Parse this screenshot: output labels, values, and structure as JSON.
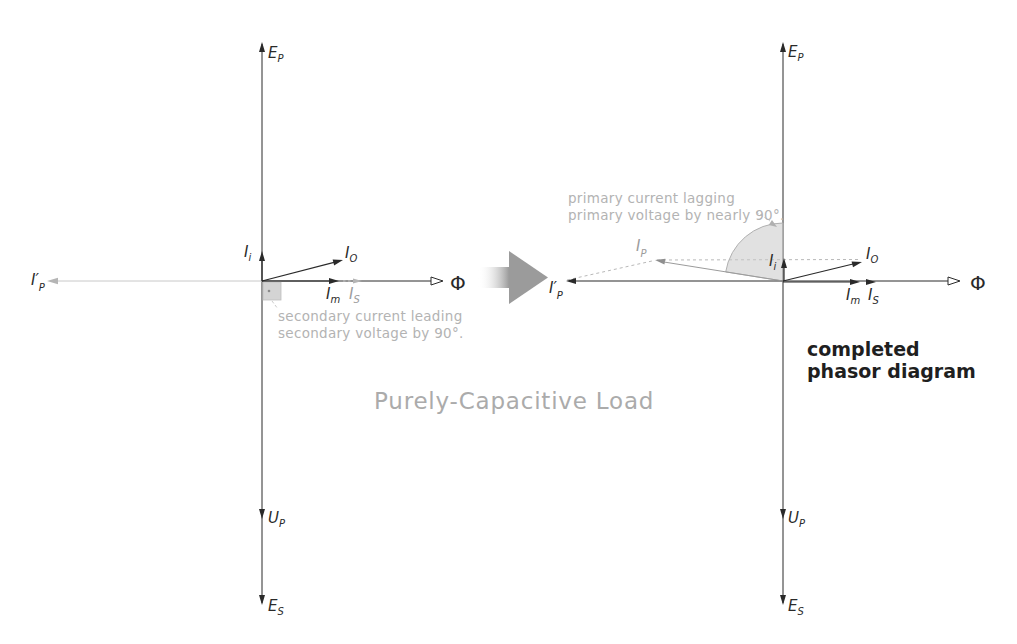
{
  "canvas": {
    "width": 1017,
    "height": 644,
    "background": "#ffffff"
  },
  "caption": {
    "text": "Purely-Capacitive Load",
    "color": "#ababab"
  },
  "colors": {
    "ink": "#2a2a2a",
    "annotation_gray": "#b3b3b3",
    "construction_gray": "#b0b0b0",
    "block_arrow_gray": "#9b9b9b",
    "angle_fill_gray": "#c9c9c9"
  },
  "symbols": {
    "e_p": {
      "main": "E",
      "sub": "P"
    },
    "u_p": {
      "main": "U",
      "sub": "P"
    },
    "e_s": {
      "main": "E",
      "sub": "S"
    },
    "phi": "Φ",
    "i_i": {
      "main": "I",
      "sub": "i"
    },
    "i_o": {
      "main": "I",
      "sub": "O"
    },
    "i_m": {
      "main": "I",
      "sub": "m"
    },
    "i_s": {
      "main": "I",
      "sub": "S"
    },
    "i_p": {
      "main": "I",
      "sub": "P"
    },
    "i_p_reflected": {
      "main": "I′",
      "sub": "P"
    }
  },
  "left_diagram": {
    "annotation_line1": "secondary current leading",
    "annotation_line2": "secondary voltage by 90°."
  },
  "right_diagram": {
    "annotation_line1": "primary current lagging",
    "annotation_line2": "primary voltage by nearly 90°.",
    "caption_line1": "completed",
    "caption_line2": "phasor diagram"
  }
}
